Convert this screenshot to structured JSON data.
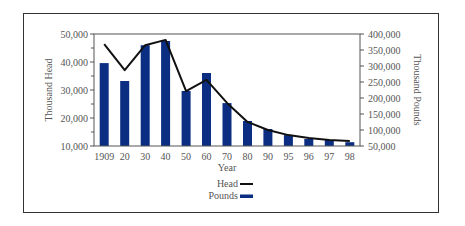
{
  "chart_data": {
    "type": "bar+line",
    "title": "",
    "xlabel": "Year",
    "categories": [
      "1909",
      "20",
      "30",
      "40",
      "50",
      "60",
      "70",
      "80",
      "90",
      "95",
      "96",
      "97",
      "98"
    ],
    "series": [
      {
        "name": "Head",
        "type": "line",
        "axis": "left",
        "color": "#111111",
        "values": [
          46400,
          37100,
          46000,
          47900,
          29600,
          33600,
          25400,
          18600,
          15700,
          13900,
          12900,
          12100,
          11800
        ]
      },
      {
        "name": "Pounds",
        "type": "bar",
        "axis": "right",
        "color": "#0b2e82",
        "values": [
          309000,
          253000,
          365000,
          378000,
          222000,
          278000,
          184000,
          128000,
          103000,
          84000,
          72000,
          69000,
          62000
        ]
      }
    ],
    "y_left": {
      "label": "Thousand Head",
      "ylim": [
        10000,
        50000
      ],
      "ticks": [
        "10,000",
        "20,000",
        "30,000",
        "40,000",
        "50,000"
      ]
    },
    "y_right": {
      "label": "Thousand Pounds",
      "ylim": [
        50000,
        400000
      ],
      "ticks": [
        "50,000",
        "100,000",
        "150,000",
        "200,000",
        "250,000",
        "300,000",
        "350,000",
        "400,000"
      ]
    },
    "grid": false,
    "legend": {
      "position": "bottom-center",
      "entries": [
        {
          "label": "Head",
          "color": "#111111",
          "style": "line"
        },
        {
          "label": "Pounds",
          "color": "#0b2e82",
          "style": "bar"
        }
      ]
    }
  }
}
